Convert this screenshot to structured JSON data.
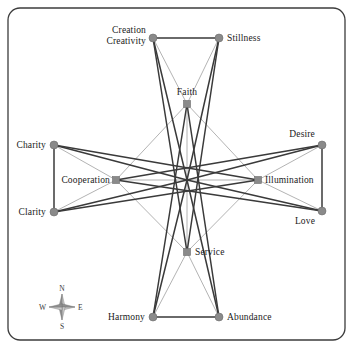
{
  "figure": {
    "type": "network-diagram",
    "background_color": "#ffffff",
    "border": {
      "color": "#3c3c3c",
      "radius": 12,
      "width": 1.3
    }
  },
  "palette": {
    "node_fill": "#8a8a8a",
    "node_stroke": "#6d6d6d",
    "edge_thick": "#3a3a3a",
    "edge_thin": "#9a9a9a",
    "text": "#1a1a1a",
    "compass": "#777777"
  },
  "nodes": [
    {
      "id": "creation_creativity",
      "label": "Creation\nCreativity",
      "label_line1": "Creation",
      "label_line2": "Creativity",
      "shape": "circle",
      "ring": "outer",
      "x": 153,
      "y": 38,
      "label_x": 146,
      "label_y": 38,
      "anchor": "end"
    },
    {
      "id": "stillness",
      "label": "Stillness",
      "shape": "circle",
      "ring": "outer",
      "x": 219,
      "y": 38,
      "label_x": 227,
      "label_y": 41,
      "anchor": "start"
    },
    {
      "id": "faith",
      "label": "Faith",
      "shape": "square",
      "ring": "inner",
      "x": 187,
      "y": 104,
      "label_x": 187,
      "label_y": 95,
      "anchor": "middle"
    },
    {
      "id": "charity",
      "label": "Charity",
      "shape": "circle",
      "ring": "outer",
      "x": 54,
      "y": 145,
      "label_x": 46,
      "label_y": 148,
      "anchor": "end"
    },
    {
      "id": "desire",
      "label": "Desire",
      "shape": "circle",
      "ring": "outer",
      "x": 322,
      "y": 145,
      "label_x": 315,
      "label_y": 137,
      "anchor": "end"
    },
    {
      "id": "cooperation",
      "label": "Cooperation",
      "shape": "square",
      "ring": "inner",
      "x": 116,
      "y": 180,
      "label_x": 110,
      "label_y": 183,
      "anchor": "end"
    },
    {
      "id": "illumination",
      "label": "Illumination",
      "shape": "square",
      "ring": "inner",
      "x": 258,
      "y": 180,
      "label_x": 265,
      "label_y": 183,
      "anchor": "start"
    },
    {
      "id": "clarity",
      "label": "Clarity",
      "shape": "circle",
      "ring": "outer",
      "x": 54,
      "y": 212,
      "label_x": 46,
      "label_y": 215,
      "anchor": "end"
    },
    {
      "id": "love",
      "label": "Love",
      "shape": "circle",
      "ring": "outer",
      "x": 322,
      "y": 211,
      "label_x": 315,
      "label_y": 224,
      "anchor": "end"
    },
    {
      "id": "service",
      "label": "Service",
      "shape": "square",
      "ring": "inner",
      "x": 187,
      "y": 252,
      "label_x": 195,
      "label_y": 255,
      "anchor": "start"
    },
    {
      "id": "harmony",
      "label": "Harmony",
      "shape": "circle",
      "ring": "outer",
      "x": 153,
      "y": 317,
      "label_x": 145,
      "label_y": 320,
      "anchor": "end"
    },
    {
      "id": "abundance",
      "label": "Abundance",
      "shape": "circle",
      "ring": "outer",
      "x": 219,
      "y": 317,
      "label_x": 227,
      "label_y": 320,
      "anchor": "start"
    }
  ],
  "center": {
    "id": "center",
    "x": 187,
    "y": 180
  },
  "edges_thick": [
    {
      "from": "creation_creativity",
      "to": "stillness"
    },
    {
      "from": "harmony",
      "to": "abundance"
    },
    {
      "from": "charity",
      "to": "clarity"
    },
    {
      "from": "desire",
      "to": "love"
    },
    {
      "from": "creation_creativity",
      "to": "center"
    },
    {
      "from": "stillness",
      "to": "center"
    },
    {
      "from": "harmony",
      "to": "center"
    },
    {
      "from": "abundance",
      "to": "center"
    },
    {
      "from": "charity",
      "to": "center"
    },
    {
      "from": "clarity",
      "to": "center"
    },
    {
      "from": "desire",
      "to": "center"
    },
    {
      "from": "love",
      "to": "center"
    },
    {
      "from": "creation_creativity",
      "to": "service"
    },
    {
      "from": "stillness",
      "to": "service"
    },
    {
      "from": "harmony",
      "to": "faith"
    },
    {
      "from": "abundance",
      "to": "faith"
    },
    {
      "from": "charity",
      "to": "illumination"
    },
    {
      "from": "clarity",
      "to": "illumination"
    },
    {
      "from": "desire",
      "to": "cooperation"
    },
    {
      "from": "love",
      "to": "cooperation"
    }
  ],
  "edges_thin": [
    {
      "from": "faith",
      "to": "center"
    },
    {
      "from": "service",
      "to": "center"
    },
    {
      "from": "cooperation",
      "to": "center"
    },
    {
      "from": "illumination",
      "to": "center"
    },
    {
      "from": "faith",
      "to": "cooperation"
    },
    {
      "from": "faith",
      "to": "illumination"
    },
    {
      "from": "service",
      "to": "cooperation"
    },
    {
      "from": "service",
      "to": "illumination"
    },
    {
      "from": "creation_creativity",
      "to": "faith"
    },
    {
      "from": "stillness",
      "to": "faith"
    },
    {
      "from": "harmony",
      "to": "service"
    },
    {
      "from": "abundance",
      "to": "service"
    },
    {
      "from": "charity",
      "to": "cooperation"
    },
    {
      "from": "clarity",
      "to": "cooperation"
    },
    {
      "from": "desire",
      "to": "illumination"
    },
    {
      "from": "love",
      "to": "illumination"
    }
  ],
  "compass": {
    "center_x": 62,
    "center_y": 307,
    "north": "N",
    "east": "E",
    "south": "S",
    "west": "W"
  }
}
